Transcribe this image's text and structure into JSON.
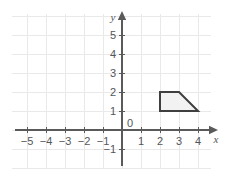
{
  "figure": {
    "width": 225,
    "height": 176,
    "background_color": "#ffffff",
    "grid_color": "#e9e9e9",
    "axis_color": "#5a5a5a",
    "label_color": "#54565a",
    "shape_stroke_color": "#3f3f3f",
    "shape_fill_color": "#f2f2f2"
  },
  "chart_data": {
    "type": "scatter",
    "title": "",
    "xlabel": "x",
    "ylabel": "y",
    "grid": true,
    "legend": null,
    "xlim": [
      -5.8,
      4.7
    ],
    "ylim": [
      -1.6,
      5.8
    ],
    "x_ticks": [
      -5,
      -4,
      -3,
      -2,
      -1,
      1,
      2,
      3,
      4
    ],
    "y_ticks": [
      -1,
      1,
      2,
      3,
      4,
      5
    ],
    "x_tick_labels": [
      "−5",
      "−4",
      "−3",
      "−2",
      "−1",
      "1",
      "2",
      "3",
      "4"
    ],
    "y_tick_labels": [
      "−1",
      "1",
      "2",
      "3",
      "4",
      "5"
    ],
    "origin_label": "0",
    "annotations": [],
    "shapes": [
      {
        "name": "trapezoid",
        "kind": "polygon",
        "closed": true,
        "vertices": [
          [
            2,
            1
          ],
          [
            2,
            2
          ],
          [
            3,
            2
          ],
          [
            4,
            1
          ]
        ],
        "fill": "#f2f2f2",
        "stroke": "#3f3f3f",
        "stroke_width": 2
      }
    ]
  },
  "axis_labels": {
    "x_axis_name": "x",
    "y_axis_name": "y"
  }
}
